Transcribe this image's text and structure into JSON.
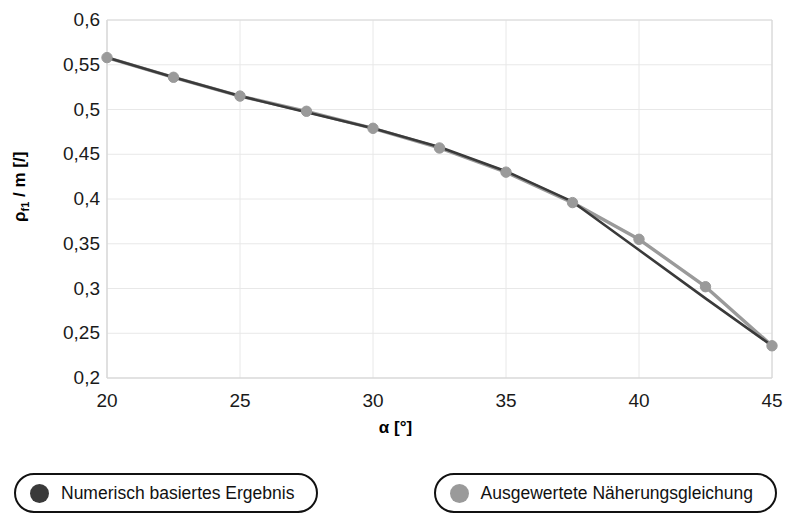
{
  "chart_data": {
    "type": "line",
    "title": "",
    "subtitle": "",
    "xlabel": "α [°]",
    "ylabel_html": "ρ<sub>f1</sub> / m [/]",
    "ylabel_plain": "ρ_f1 / m [/]",
    "xlim": [
      20,
      45
    ],
    "ylim": [
      0.2,
      0.6
    ],
    "xticks": [
      20,
      25,
      30,
      35,
      40,
      45
    ],
    "xtick_labels": [
      "20",
      "25",
      "30",
      "35",
      "40",
      "45"
    ],
    "yticks": [
      0.2,
      0.25,
      0.3,
      0.35,
      0.4,
      0.45,
      0.5,
      0.55,
      0.6
    ],
    "ytick_labels": [
      "0,2",
      "0,25",
      "0,3",
      "0,35",
      "0,4",
      "0,45",
      "0,5",
      "0,55",
      "0,6"
    ],
    "grid": true,
    "grid_color": "#e8e8e8",
    "axis_color": "#d9d9d9",
    "legend_position": "below",
    "x": [
      20,
      22.5,
      25,
      27.5,
      30,
      32.5,
      35,
      37.5,
      40,
      42.5,
      45
    ],
    "series": [
      {
        "name": "Numerisch basiertes Ergebnis",
        "color": "#3a3a3a",
        "marker": "circle",
        "marker_visible": false,
        "values": [
          0.558,
          0.536,
          0.515,
          0.497,
          0.479,
          0.458,
          0.431,
          0.397,
          0.343,
          0.289,
          0.236
        ]
      },
      {
        "name": "Ausgewertete Näherungsgleichung",
        "color": "#9a9a9a",
        "marker": "circle",
        "marker_visible": true,
        "values": [
          0.558,
          0.536,
          0.515,
          0.498,
          0.479,
          0.457,
          0.43,
          0.396,
          0.355,
          0.302,
          0.236
        ]
      }
    ]
  },
  "legend": {
    "items": [
      {
        "label": "Numerisch basiertes Ergebnis",
        "color": "#3a3a3a"
      },
      {
        "label": "Ausgewertete Näherungsgleichung",
        "color": "#9a9a9a"
      }
    ]
  }
}
